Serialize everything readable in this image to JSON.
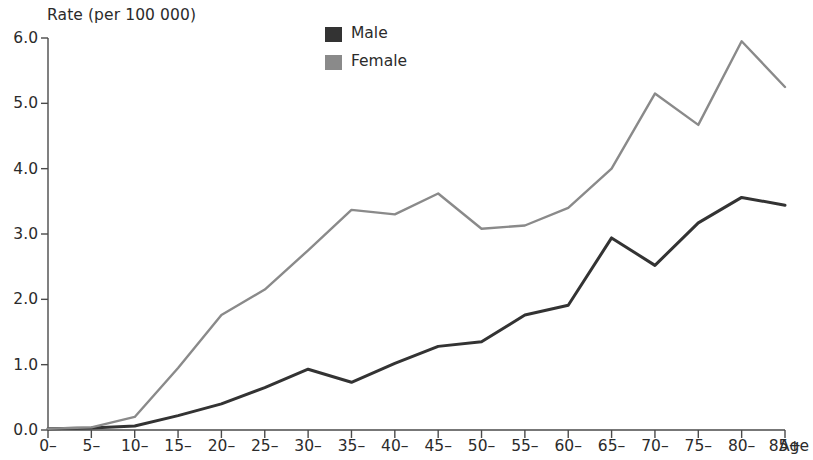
{
  "chart_data": {
    "type": "line",
    "title": "Rate (per 100 000)",
    "ylabel": "Rate (per 100 000)",
    "xlabel": "Age",
    "categories": [
      "0–",
      "5–",
      "10–",
      "15–",
      "20–",
      "25–",
      "30–",
      "35–",
      "40–",
      "45–",
      "50–",
      "55–",
      "60–",
      "65–",
      "70–",
      "75–",
      "80–",
      "85+"
    ],
    "ylim": [
      0.0,
      6.0
    ],
    "yticks": [
      "0.0",
      "1.0",
      "2.0",
      "3.0",
      "4.0",
      "5.0",
      "6.0"
    ],
    "ytick_values": [
      0.0,
      1.0,
      2.0,
      3.0,
      4.0,
      5.0,
      6.0
    ],
    "grid": false,
    "legend_position": "top-center",
    "series": [
      {
        "name": "Male",
        "color": "#333333",
        "values": [
          0.02,
          0.03,
          0.06,
          0.22,
          0.4,
          0.65,
          0.93,
          0.73,
          1.02,
          1.28,
          1.35,
          1.76,
          1.91,
          2.94,
          2.52,
          3.17,
          3.56,
          3.44
        ]
      },
      {
        "name": "Female",
        "color": "#8a8a8a",
        "values": [
          0.02,
          0.04,
          0.2,
          0.95,
          1.76,
          2.15,
          2.75,
          3.37,
          3.3,
          3.62,
          3.08,
          3.13,
          3.4,
          4.0,
          5.15,
          4.67,
          5.95,
          5.25
        ]
      }
    ]
  },
  "legend": {
    "items": [
      {
        "label": "Male",
        "color": "#333333"
      },
      {
        "label": "Female",
        "color": "#8a8a8a"
      }
    ]
  },
  "axes": {
    "y_title": "Rate (per 100 000)",
    "x_title": "Age"
  }
}
